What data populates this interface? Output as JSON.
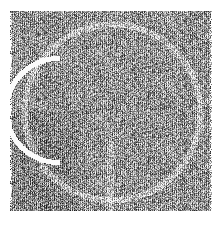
{
  "image": {
    "description": "Grayscale halftone-like noisy texture with a faint large circular arc and a bright white curved stroke on the left side",
    "background_color": "#ffffff",
    "texture_dark": "#3a3a3a",
    "texture_light": "#f2f2f2",
    "mean_tone": "#9a9a9a",
    "text_content": []
  }
}
